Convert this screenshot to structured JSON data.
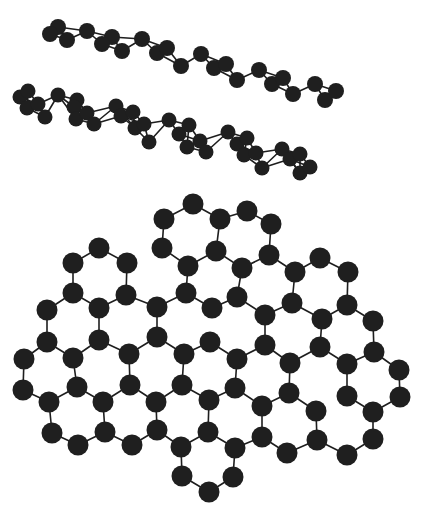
{
  "figure": {
    "colors": {
      "atom": "#1f1f1f",
      "bond": "#1e1e1e",
      "background": "#ffffff"
    }
  },
  "layers": [
    {
      "name": "stacked-sheet-upper",
      "atom_radius": 8,
      "bond_max": 32,
      "atoms": [
        [
          58,
          27
        ],
        [
          50,
          34
        ],
        [
          87,
          31
        ],
        [
          67,
          40
        ],
        [
          112,
          37
        ],
        [
          102,
          44
        ],
        [
          122,
          51
        ],
        [
          142,
          39
        ],
        [
          157,
          53
        ],
        [
          167,
          48
        ],
        [
          181,
          66
        ],
        [
          201,
          54
        ],
        [
          214,
          68
        ],
        [
          226,
          64
        ],
        [
          237,
          80
        ],
        [
          259,
          70
        ],
        [
          272,
          84
        ],
        [
          283,
          78
        ],
        [
          293,
          94
        ],
        [
          315,
          84
        ],
        [
          325,
          100
        ],
        [
          336,
          91
        ]
      ]
    },
    {
      "name": "stacked-sheet-lower",
      "atom_radius": 7.5,
      "bond_max": 30,
      "atoms": [
        [
          20,
          97
        ],
        [
          28,
          91
        ],
        [
          27,
          108
        ],
        [
          38,
          104
        ],
        [
          58,
          95
        ],
        [
          45,
          117
        ],
        [
          77,
          100
        ],
        [
          74,
          107
        ],
        [
          76,
          119
        ],
        [
          87,
          113
        ],
        [
          94,
          124
        ],
        [
          116,
          106
        ],
        [
          121,
          116
        ],
        [
          133,
          112
        ],
        [
          135,
          128
        ],
        [
          144,
          124
        ],
        [
          149,
          142
        ],
        [
          169,
          120
        ],
        [
          179,
          134
        ],
        [
          187,
          147
        ],
        [
          189,
          125
        ],
        [
          200,
          141
        ],
        [
          206,
          152
        ],
        [
          228,
          132
        ],
        [
          237,
          144
        ],
        [
          247,
          138
        ],
        [
          244,
          155
        ],
        [
          256,
          153
        ],
        [
          262,
          168
        ],
        [
          282,
          149
        ],
        [
          290,
          159
        ],
        [
          300,
          154
        ],
        [
          300,
          173
        ],
        [
          310,
          167
        ]
      ]
    },
    {
      "name": "flat-graphene-sheet",
      "atom_radius": 10.5,
      "bond_max": 34,
      "atoms": [
        [
          193,
          204
        ],
        [
          164,
          219
        ],
        [
          220,
          219
        ],
        [
          247,
          211
        ],
        [
          271,
          224
        ],
        [
          99,
          248
        ],
        [
          73,
          263
        ],
        [
          127,
          263
        ],
        [
          162,
          248
        ],
        [
          188,
          266
        ],
        [
          216,
          251
        ],
        [
          242,
          268
        ],
        [
          269,
          255
        ],
        [
          295,
          272
        ],
        [
          320,
          258
        ],
        [
          348,
          272
        ],
        [
          73,
          293
        ],
        [
          126,
          295
        ],
        [
          99,
          308
        ],
        [
          47,
          310
        ],
        [
          157,
          307
        ],
        [
          186,
          293
        ],
        [
          212,
          308
        ],
        [
          237,
          297
        ],
        [
          265,
          315
        ],
        [
          292,
          303
        ],
        [
          322,
          319
        ],
        [
          347,
          305
        ],
        [
          373,
          321
        ],
        [
          47,
          342
        ],
        [
          99,
          340
        ],
        [
          73,
          358
        ],
        [
          129,
          354
        ],
        [
          157,
          337
        ],
        [
          184,
          354
        ],
        [
          210,
          342
        ],
        [
          237,
          359
        ],
        [
          265,
          345
        ],
        [
          290,
          363
        ],
        [
          320,
          347
        ],
        [
          347,
          364
        ],
        [
          374,
          352
        ],
        [
          399,
          370
        ],
        [
          24,
          359
        ],
        [
          23,
          390
        ],
        [
          49,
          402
        ],
        [
          77,
          387
        ],
        [
          103,
          402
        ],
        [
          130,
          385
        ],
        [
          156,
          402
        ],
        [
          182,
          385
        ],
        [
          209,
          400
        ],
        [
          235,
          388
        ],
        [
          262,
          406
        ],
        [
          289,
          393
        ],
        [
          316,
          411
        ],
        [
          347,
          396
        ],
        [
          373,
          412
        ],
        [
          400,
          397
        ],
        [
          52,
          433
        ],
        [
          78,
          445
        ],
        [
          105,
          432
        ],
        [
          132,
          445
        ],
        [
          157,
          430
        ],
        [
          181,
          447
        ],
        [
          208,
          432
        ],
        [
          235,
          448
        ],
        [
          262,
          437
        ],
        [
          287,
          453
        ],
        [
          317,
          440
        ],
        [
          347,
          455
        ],
        [
          373,
          439
        ],
        [
          182,
          476
        ],
        [
          209,
          492
        ],
        [
          233,
          477
        ]
      ]
    }
  ]
}
